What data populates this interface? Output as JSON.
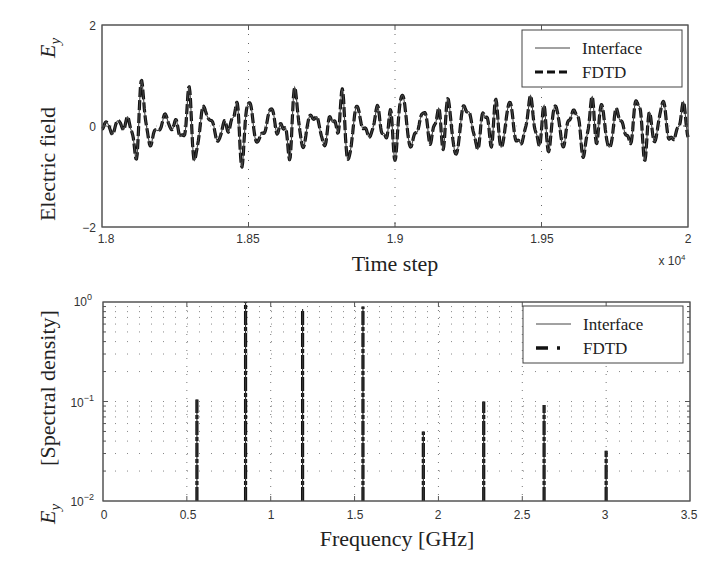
{
  "chart_data": [
    {
      "type": "line",
      "title": "",
      "xlabel": "Time step",
      "ylabel": "Electric field  E_y",
      "ylabel_main": "Electric field",
      "ylabel_symbol": "E",
      "ylabel_sub": "y",
      "x_multiplier_label": "x 10",
      "x_multiplier_exp": "4",
      "xlim": [
        1.8,
        2.0
      ],
      "ylim": [
        -2,
        2
      ],
      "xticks": [
        "1.8",
        "1.85",
        "1.9",
        "1.95",
        "2"
      ],
      "yticks": [
        "2",
        "0",
        "−2"
      ],
      "grid": "vertical dotted at x ticks",
      "legend": {
        "position": "upper right",
        "entries": [
          "Interface",
          "FDTD"
        ]
      },
      "series": [
        {
          "name": "Interface",
          "style": "thin solid",
          "description": "multi-frequency oscillation, amplitude roughly ±0.8 around 0"
        },
        {
          "name": "FDTD",
          "style": "thick dashed",
          "description": "overlaps Interface curve"
        }
      ],
      "components_GHz": [
        0.56,
        0.86,
        1.2,
        1.55,
        1.91,
        2.27,
        2.63,
        3.0
      ],
      "approx_amplitude_range": [
        -0.85,
        0.9
      ]
    },
    {
      "type": "bar",
      "title": "",
      "xlabel": "Frequency [GHz]",
      "ylabel": "E_y  [Spectral density]",
      "ylabel_main": "[Spectral density]",
      "ylabel_symbol": "E",
      "ylabel_sub": "y",
      "xlim": [
        0,
        3.5
      ],
      "ylim": [
        0.01,
        1
      ],
      "yscale": "log",
      "xticks": [
        "0",
        "0.5",
        "1",
        "1.5",
        "2",
        "2.5",
        "3",
        "3.5"
      ],
      "yticks": [
        {
          "base": "10",
          "exp": "0"
        },
        {
          "base": "10",
          "exp": "−1"
        },
        {
          "base": "10",
          "exp": "−2"
        }
      ],
      "grid": "dotted major and minor",
      "legend": {
        "position": "upper right",
        "entries": [
          "Interface",
          "FDTD"
        ]
      },
      "x": [
        0.56,
        0.85,
        1.19,
        1.55,
        1.91,
        2.27,
        2.63,
        3.0
      ],
      "series": [
        {
          "name": "Interface",
          "values": [
            0.105,
            1.0,
            0.85,
            0.9,
            0.05,
            0.1,
            0.092,
            0.032
          ]
        },
        {
          "name": "FDTD",
          "values": [
            0.105,
            1.0,
            0.85,
            0.9,
            0.05,
            0.1,
            0.092,
            0.032
          ]
        }
      ]
    }
  ],
  "top": {
    "ylabel_main": "Electric field",
    "ylabel_symbol": "E",
    "ylabel_sub": "y",
    "xlabel": "Time step",
    "xticks": [
      "1.8",
      "1.85",
      "1.9",
      "1.95",
      "2"
    ],
    "yticks": [
      "2",
      "0",
      "−2"
    ],
    "multiplier": "x 10",
    "multiplier_exp": "4",
    "legend": [
      "Interface",
      "FDTD"
    ]
  },
  "bottom": {
    "ylabel_main": "[Spectral density]",
    "ylabel_symbol": "E",
    "ylabel_sub": "y",
    "xlabel": "Frequency [GHz]",
    "xticks": [
      "0",
      "0.5",
      "1",
      "1.5",
      "2",
      "2.5",
      "3",
      "3.5"
    ],
    "ytick_base": "10",
    "ytick_exps": [
      "0",
      "−1",
      "−2"
    ],
    "legend": [
      "Interface",
      "FDTD"
    ]
  }
}
